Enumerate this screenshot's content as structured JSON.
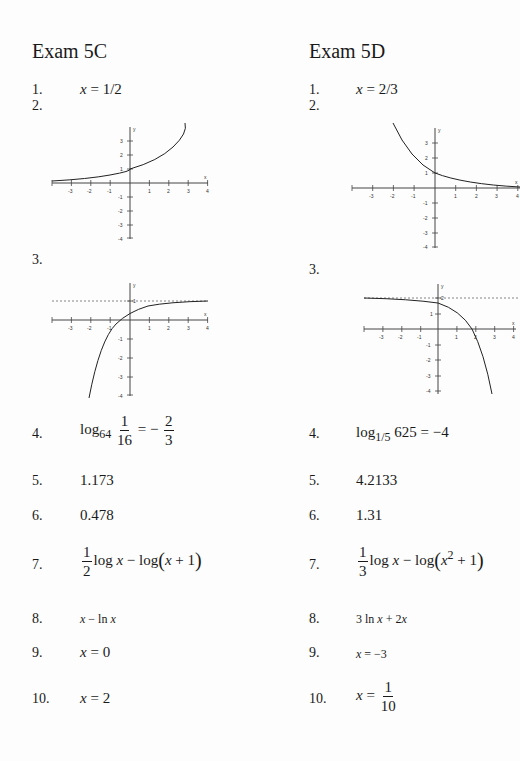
{
  "columns": [
    {
      "title": "Exam 5C",
      "items": [
        {
          "num": "1.",
          "answer": "x = 1/2"
        },
        {
          "num": "2.",
          "answer_type": "graph",
          "graph": "graph_5c_2"
        },
        {
          "num": "3.",
          "answer_type": "graph",
          "graph": "graph_5c_3"
        },
        {
          "num": "4.",
          "log_base": "64",
          "frac_num": "1",
          "frac_den": "16",
          "eq": "= −",
          "rhs_num": "2",
          "rhs_den": "3"
        },
        {
          "num": "5.",
          "answer": "1.173"
        },
        {
          "num": "6.",
          "answer": "0.478"
        },
        {
          "num": "7.",
          "coef_num": "1",
          "coef_den": "2",
          "expr_a": "log ",
          "var": "x",
          "expr_b": " − log",
          "inner": "x + 1"
        },
        {
          "num": "8.",
          "answer": "x − ln x"
        },
        {
          "num": "9.",
          "answer": "x = 0"
        },
        {
          "num": "10.",
          "answer": "x = 2"
        }
      ]
    },
    {
      "title": "Exam 5D",
      "items": [
        {
          "num": "1.",
          "answer": "x = 2/3"
        },
        {
          "num": "2.",
          "answer_type": "graph",
          "graph": "graph_5d_2"
        },
        {
          "num": "3.",
          "answer_type": "graph",
          "graph": "graph_5d_3"
        },
        {
          "num": "4.",
          "log_base": "1/5",
          "arg": "625",
          "eq": "= −4"
        },
        {
          "num": "5.",
          "answer": "4.2133"
        },
        {
          "num": "6.",
          "answer": "1.31"
        },
        {
          "num": "7.",
          "coef_num": "1",
          "coef_den": "3",
          "expr_a": "log ",
          "var": "x",
          "expr_b": " − log",
          "inner_var": "x",
          "inner_exp": "2",
          "inner_rest": " + 1"
        },
        {
          "num": "8.",
          "answer": "3 ln x + 2x"
        },
        {
          "num": "9.",
          "answer": "x = −3"
        },
        {
          "num": "10.",
          "lhs": "x =",
          "frac_num": "1",
          "frac_den": "10"
        }
      ]
    }
  ],
  "graphs": {
    "axis_x_label": "x",
    "axis_y_label": "y",
    "x_ticks": [
      "-3",
      "-2",
      "-1",
      "1",
      "2",
      "3",
      "4"
    ],
    "graph_5c_2": {
      "y_ticks": [
        "3",
        "2",
        "1",
        "-1",
        "-2",
        "-3",
        "-4"
      ],
      "curve": "increasing exponential through (0,1)"
    },
    "graph_5c_3": {
      "y_ticks": [
        "1",
        "-1",
        "-2",
        "-3",
        "-4"
      ],
      "asymptote": "y = 1",
      "curve": "increasing, approaches y=1"
    },
    "graph_5d_2": {
      "y_ticks": [
        "3",
        "2",
        "1",
        "-1",
        "-2",
        "-3",
        "-4"
      ],
      "curve": "decreasing exponential through (0,1)"
    },
    "graph_5d_3": {
      "y_ticks": [
        "2",
        "1",
        "-1",
        "-2",
        "-3",
        "-4"
      ],
      "asymptote": "y = 2",
      "curve": "decreasing from asymptote y=2"
    }
  }
}
